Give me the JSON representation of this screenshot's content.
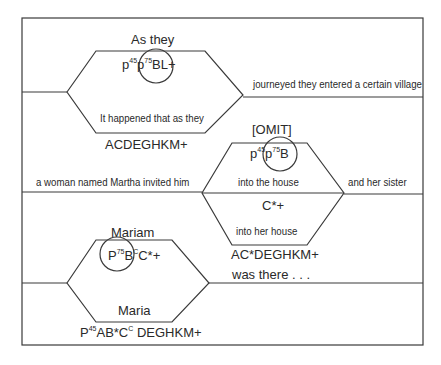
{
  "diagram": {
    "stroke_color": "#3a3a3a",
    "rows": [
      {
        "above": "As they",
        "hex_top": [
          "p",
          "45",
          "p",
          "75",
          "BL+"
        ],
        "hex_bottom": "It happened that as they",
        "below": "ACDEGHKM+",
        "right_text": "journeyed they entered a certain village"
      },
      {
        "above": "[OMIT]",
        "hex_top": [
          "p",
          "45",
          "p",
          "75",
          "B"
        ],
        "hex_upper_text": "into the house",
        "hex_lower_top": "C*+",
        "hex_lower_text": "into her house",
        "below": "AC*DEGHKM+",
        "left_text": "a woman named Martha invited him",
        "right_text": "and her sister",
        "after": "was there . . ."
      },
      {
        "above": "Mariam",
        "hex_top": [
          "P",
          "75",
          "B",
          "C",
          "C*+"
        ],
        "hex_bottom": "Maria",
        "below_parts": [
          "P",
          "45",
          "AB*C",
          "C",
          " DEGHKM+"
        ]
      }
    ]
  }
}
